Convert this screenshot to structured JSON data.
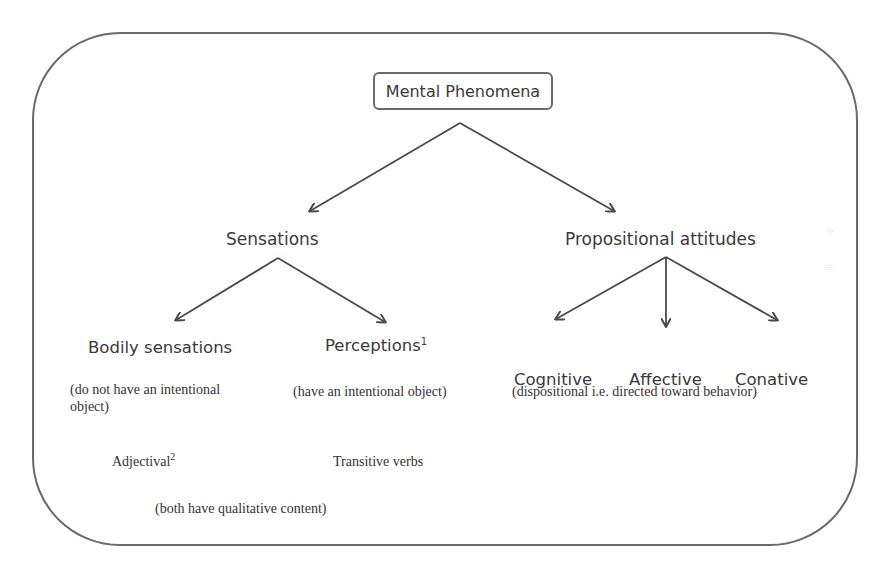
{
  "diagram": {
    "title": "Mental Phenomena",
    "branches": {
      "sensations": {
        "label": "Sensations",
        "children": {
          "bodily": {
            "label": "Bodily sensations",
            "note_line1": "(do not have an intentional",
            "note_line2": "object)",
            "grammar": "Adjectival",
            "grammar_sup": "2"
          },
          "perceptions": {
            "label": "Perceptions",
            "label_sup": "1",
            "note": "(have an intentional object)",
            "grammar": "Transitive verbs"
          }
        },
        "shared_note": "(both have qualitative content)"
      },
      "propositional_attitudes": {
        "label": "Propositional attitudes",
        "children": {
          "cognitive": {
            "label": "Cognitive"
          },
          "affective": {
            "label": "Affective"
          },
          "conative": {
            "label": "Conative"
          }
        },
        "note": "(dispositional i.e. directed toward behavior)"
      }
    }
  },
  "colors": {
    "line": "#4a4a4a",
    "frame": "#6a6a6a",
    "text": "#3a3a3a"
  }
}
